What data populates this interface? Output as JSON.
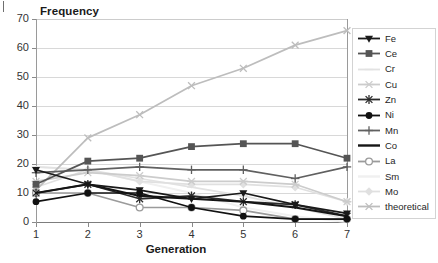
{
  "chart_data": {
    "type": "line",
    "title": "",
    "ylabel": "Frequency",
    "xlabel": "Generation",
    "x": [
      1,
      2,
      3,
      4,
      5,
      6,
      7
    ],
    "xtick_labels": [
      "1",
      "2",
      "3",
      "4",
      "5",
      "6",
      "7"
    ],
    "ytick_labels": [
      "0",
      "10",
      "20",
      "30",
      "40",
      "50",
      "60",
      "70"
    ],
    "ylim": [
      0,
      70
    ],
    "ytick_step": 10,
    "grid": "horizontal",
    "legend_position": "right",
    "series": [
      {
        "name": "Fe",
        "color": "#1a1a1a",
        "marker": "triangle-down",
        "values": [
          18,
          13,
          11,
          8,
          10,
          6,
          3
        ]
      },
      {
        "name": "Ce",
        "color": "#555555",
        "marker": "square",
        "values": [
          13,
          21,
          22,
          26,
          27,
          27,
          22
        ]
      },
      {
        "name": "Cr",
        "color": "#e2e2e2",
        "marker": "line",
        "values": [
          19,
          18,
          15,
          12,
          9,
          5,
          1
        ]
      },
      {
        "name": "Cu",
        "color": "#cccccc",
        "marker": "star",
        "values": [
          14,
          17,
          16,
          14,
          14,
          13,
          7
        ]
      },
      {
        "name": "Zn",
        "color": "#2b2b2b",
        "marker": "asterisk",
        "values": [
          10,
          13,
          8,
          9,
          7,
          6,
          2
        ]
      },
      {
        "name": "Ni",
        "color": "#111111",
        "marker": "circle-filled",
        "values": [
          7,
          10,
          10,
          5,
          2,
          1,
          1
        ]
      },
      {
        "name": "Mn",
        "color": "#606060",
        "marker": "plus",
        "values": [
          17,
          18,
          19,
          18,
          18,
          15,
          19
        ]
      },
      {
        "name": "Co",
        "color": "#151515",
        "marker": "none",
        "values": [
          10,
          13,
          9,
          8,
          7,
          5,
          2
        ]
      },
      {
        "name": "La",
        "color": "#9b9b9b",
        "marker": "circle-open",
        "values": [
          10,
          10,
          5,
          5,
          4,
          1,
          1
        ]
      },
      {
        "name": "Sm",
        "color": "#f0f0f0",
        "marker": "none",
        "values": [
          19,
          18,
          14,
          10,
          5,
          2,
          0
        ]
      },
      {
        "name": "Mo",
        "color": "#e0e0e0",
        "marker": "diamond",
        "values": [
          12,
          18,
          14,
          13,
          13,
          12,
          7
        ]
      },
      {
        "name": "theoretical",
        "color": "#bdbdbd",
        "marker": "x",
        "values": [
          11,
          29,
          37,
          47,
          53,
          61,
          66
        ]
      }
    ]
  },
  "legend": {
    "items": [
      {
        "label": "Fe"
      },
      {
        "label": "Ce"
      },
      {
        "label": "Cr"
      },
      {
        "label": "Cu"
      },
      {
        "label": "Zn"
      },
      {
        "label": "Ni"
      },
      {
        "label": "Mn"
      },
      {
        "label": "Co"
      },
      {
        "label": "La"
      },
      {
        "label": "Sm"
      },
      {
        "label": "Mo"
      },
      {
        "label": "theoretical"
      }
    ]
  },
  "icons": {
    "corner_mark": "crop-mark-icon"
  }
}
